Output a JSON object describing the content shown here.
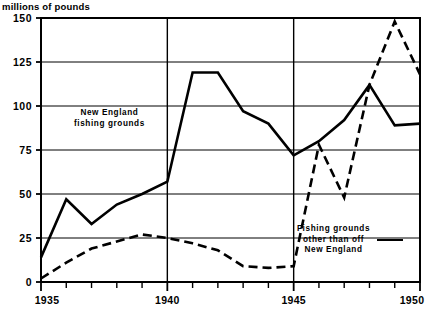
{
  "chart_data": {
    "type": "line",
    "title": "millions of pounds",
    "xlabel": "",
    "ylabel": "millions of pounds",
    "xlim": [
      1935,
      1950
    ],
    "ylim": [
      0,
      150
    ],
    "yticks": [
      0,
      25,
      50,
      75,
      100,
      125,
      150
    ],
    "ytick_labels": [
      "0",
      "25",
      "50",
      "75",
      "100",
      "125",
      "150"
    ],
    "xticks": [
      1935,
      1936,
      1937,
      1938,
      1939,
      1940,
      1941,
      1942,
      1943,
      1944,
      1945,
      1946,
      1947,
      1948,
      1949,
      1950
    ],
    "xtick_labels_shown": [
      "1935",
      "1940",
      "1945",
      "1950"
    ],
    "grid": "horizontal gridlines at every 25 units; vertical gridlines at 1940 and 1945",
    "legend_position": "inline annotations on plot",
    "x": [
      1935,
      1936,
      1937,
      1938,
      1939,
      1940,
      1941,
      1942,
      1943,
      1944,
      1945,
      1946,
      1947,
      1948,
      1949,
      1950
    ],
    "series": [
      {
        "name": "New England fishing grounds",
        "style": "solid",
        "values": [
          14,
          47,
          33,
          44,
          50,
          57,
          119,
          119,
          97,
          90,
          72,
          80,
          92,
          112,
          89,
          90
        ]
      },
      {
        "name": "Fishing grounds other than off New England",
        "style": "dashed",
        "values": [
          2,
          11,
          19,
          23,
          27,
          25,
          22,
          18,
          9,
          8,
          9,
          78,
          48,
          112,
          148,
          118
        ]
      }
    ],
    "annotations": [
      {
        "id": "new-england",
        "line1": "New England",
        "line2": "fishing grounds"
      },
      {
        "id": "other",
        "line1": "Fishing grounds",
        "line2": "other than off",
        "line3": "New England"
      }
    ],
    "colors": {
      "line": "#000000",
      "grid": "#000000",
      "background": "#ffffff"
    }
  }
}
